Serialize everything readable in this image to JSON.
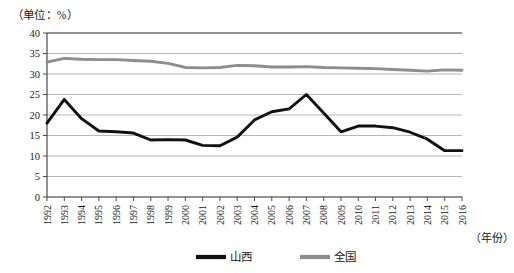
{
  "chart_data": {
    "type": "line",
    "title": "",
    "unit_label": "（单位：%）",
    "xlabel": "（年份）",
    "ylabel": "",
    "ylim": [
      0,
      40
    ],
    "ytick_step": 5,
    "yticks": [
      "0",
      "5",
      "10",
      "15",
      "20",
      "25",
      "30",
      "35",
      "40"
    ],
    "grid": true,
    "legend_position": "bottom-center",
    "categories": [
      "1992",
      "1993",
      "1994",
      "1995",
      "1996",
      "1997",
      "1998",
      "1999",
      "2000",
      "2001",
      "2002",
      "2003",
      "2004",
      "2005",
      "2006",
      "2007",
      "2008",
      "2009",
      "2010",
      "2011",
      "2012",
      "2013",
      "2014",
      "2015",
      "2016"
    ],
    "series": [
      {
        "name": "山西",
        "color": "#111111",
        "values": [
          18.0,
          23.8,
          19.1,
          16.1,
          15.9,
          15.6,
          13.9,
          14.0,
          13.9,
          12.6,
          12.5,
          14.6,
          18.8,
          20.8,
          21.5,
          25.0,
          20.5,
          15.9,
          17.3,
          17.3,
          16.9,
          15.8,
          14.1,
          11.3,
          11.3
        ]
      },
      {
        "name": "全国",
        "color": "#8d8d8d",
        "values": [
          32.9,
          33.8,
          33.6,
          33.5,
          33.5,
          33.3,
          33.1,
          32.6,
          31.6,
          31.5,
          31.6,
          32.1,
          32.0,
          31.7,
          31.7,
          31.8,
          31.6,
          31.5,
          31.4,
          31.3,
          31.1,
          30.9,
          30.7,
          31.0,
          30.9
        ]
      }
    ]
  },
  "legend": {
    "items": [
      {
        "label": "山西",
        "color": "#111111"
      },
      {
        "label": "全国",
        "color": "#8d8d8d"
      }
    ]
  }
}
